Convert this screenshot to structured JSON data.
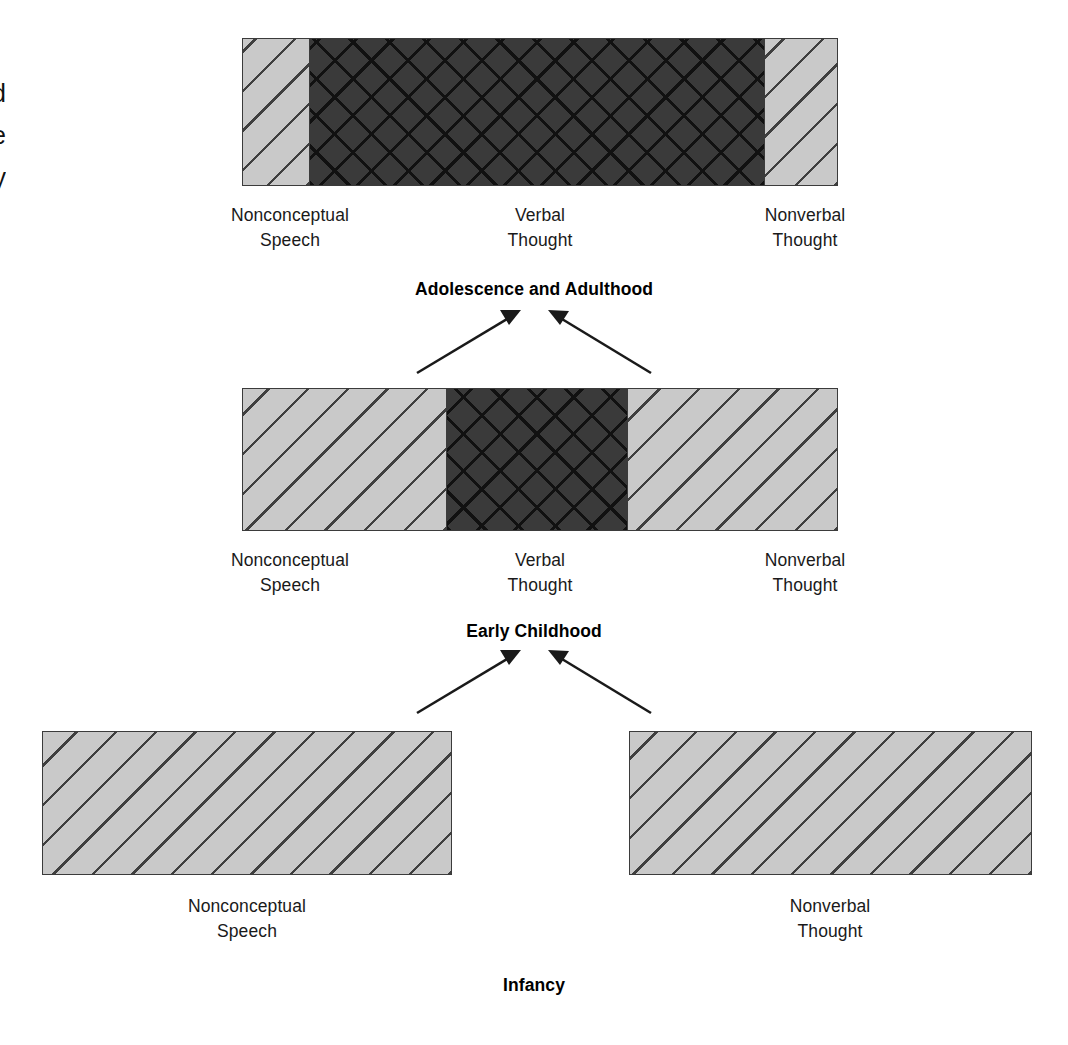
{
  "figure": {
    "type": "developmental-stage-diagram",
    "background_color": "#ffffff",
    "light_fill_color": "#c9c9c9",
    "dark_fill_color": "#3a3a3a",
    "line_color": "#3b3b3b"
  },
  "margin_fragment": {
    "text": "d\ne\ny",
    "note": "partial letters cropped at the left page margin"
  },
  "levels": [
    {
      "id": "adolescence",
      "stage_label": "Adolescence and Adulthood",
      "segments": [
        {
          "label": "Nonconceptual\nSpeech",
          "fill": "light"
        },
        {
          "label": "Verbal\nThought",
          "fill": "dark"
        },
        {
          "label": "Nonverbal\nThought",
          "fill": "light"
        }
      ]
    },
    {
      "id": "early-childhood",
      "stage_label": "Early Childhood",
      "segments": [
        {
          "label": "Nonconceptual\nSpeech",
          "fill": "light"
        },
        {
          "label": "Verbal\nThought",
          "fill": "dark"
        },
        {
          "label": "Nonverbal\nThought",
          "fill": "light"
        }
      ]
    },
    {
      "id": "infancy",
      "stage_label": "Infancy",
      "segments": [
        {
          "label": "Nonconceptual\nSpeech",
          "fill": "light"
        },
        {
          "label": "Nonverbal\nThought",
          "fill": "light"
        }
      ]
    }
  ],
  "arrows": {
    "count": 4,
    "direction": "upward-converging",
    "description": "two arrows from each lower level point up toward the stage above"
  }
}
